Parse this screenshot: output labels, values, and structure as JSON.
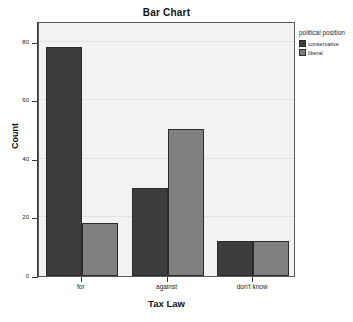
{
  "chart_data": {
    "type": "bar",
    "title": "Bar Chart",
    "xlabel": "Tax Law",
    "ylabel": "Count",
    "categories": [
      "for",
      "against",
      "don't know"
    ],
    "series": [
      {
        "name": "conservative",
        "color": "#3d3d3d",
        "values": [
          78,
          30,
          12
        ]
      },
      {
        "name": "liberal",
        "color": "#808080",
        "values": [
          18,
          50,
          12
        ]
      }
    ],
    "legend_title": "political position",
    "legend_position": "right",
    "ylim": [
      0,
      87
    ],
    "yticks": [
      0,
      20,
      40,
      60,
      80
    ],
    "ytick_labels": [
      "0",
      "20",
      "40",
      "60",
      "80"
    ],
    "grid": true,
    "plot_background": "#f2f2f2",
    "grouping": "clustered"
  }
}
